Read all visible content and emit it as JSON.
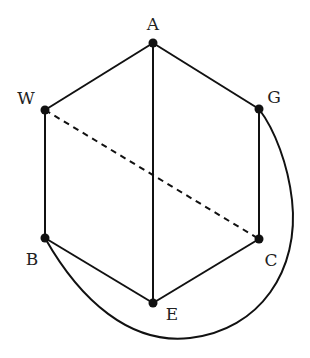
{
  "diagram": {
    "type": "graph",
    "nodes": [
      {
        "id": "A",
        "label": "A",
        "x": 153,
        "y": 43,
        "lx": 153,
        "ly": 30
      },
      {
        "id": "W",
        "label": "W",
        "x": 45,
        "y": 110,
        "lx": 26,
        "ly": 104
      },
      {
        "id": "G",
        "label": "G",
        "x": 259,
        "y": 109,
        "lx": 274,
        "ly": 103
      },
      {
        "id": "B",
        "label": "B",
        "x": 45,
        "y": 238,
        "lx": 32,
        "ly": 265
      },
      {
        "id": "C",
        "label": "C",
        "x": 259,
        "y": 239,
        "lx": 271,
        "ly": 266
      },
      {
        "id": "E",
        "label": "E",
        "x": 153,
        "y": 303,
        "lx": 172,
        "ly": 320
      }
    ],
    "edges": [
      {
        "from": "A",
        "to": "W",
        "style": "solid"
      },
      {
        "from": "A",
        "to": "G",
        "style": "solid"
      },
      {
        "from": "A",
        "to": "E",
        "style": "solid"
      },
      {
        "from": "W",
        "to": "B",
        "style": "solid"
      },
      {
        "from": "G",
        "to": "C",
        "style": "solid"
      },
      {
        "from": "B",
        "to": "E",
        "style": "solid"
      },
      {
        "from": "C",
        "to": "E",
        "style": "solid"
      },
      {
        "from": "W",
        "to": "C",
        "style": "dashed"
      },
      {
        "from": "B",
        "to": "G",
        "style": "curved"
      }
    ],
    "colors": {
      "stroke": "#111111",
      "node": "#111111",
      "background": "#ffffff"
    }
  }
}
